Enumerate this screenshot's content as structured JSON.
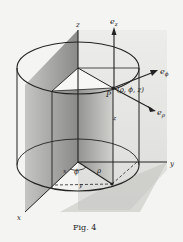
{
  "figure": {
    "caption": "Fig. 4",
    "axes": {
      "x": "x",
      "y": "y",
      "z": "z"
    },
    "point_label": "P",
    "point_coords": "(ρ, ϕ, z)",
    "unit_vectors": {
      "e_z": "e",
      "e_z_sub": "z",
      "e_phi": "e",
      "e_phi_sub": "ϕ",
      "e_rho": "e",
      "e_rho_sub": "ρ"
    },
    "base_labels": {
      "x": "x",
      "phi": "ϕ",
      "rho": "ρ",
      "y": "y"
    },
    "height_label": "z"
  },
  "colors": {
    "background": "#f4f4f2",
    "ink": "#222222",
    "shade_dark": "#6a6a6a",
    "shade_light": "#d9d9d6"
  }
}
